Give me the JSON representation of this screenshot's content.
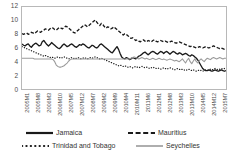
{
  "chart_data": {
    "type": "line",
    "title": "",
    "xlabel": "",
    "ylabel": "",
    "ylim": [
      0,
      12
    ],
    "yticks": [
      0,
      2,
      4,
      6,
      8,
      10,
      12
    ],
    "grid": false,
    "legend_position": "bottom",
    "x_tick_labels": [
      "2005M1",
      "2005M8",
      "2006M3",
      "2006M10",
      "2007M5",
      "2007M12",
      "2008M7",
      "2009M2",
      "2009M9",
      "2010M4",
      "2010M11",
      "2011M6",
      "2012M1",
      "2012M8",
      "2013M3",
      "2013M10",
      "2014M5",
      "2014M12",
      "2015M7"
    ],
    "x_tick_interval_months": 7,
    "x_start": "2005M1",
    "x_end": "2015M12",
    "n_points": 132,
    "series": [
      {
        "name": "Jamaica",
        "color": "#1a1a1a",
        "style": "solid",
        "values": [
          6.6,
          6.4,
          6.3,
          6.5,
          6.6,
          6.3,
          6.1,
          6.4,
          6.6,
          6.7,
          6.5,
          6.3,
          6.4,
          6.9,
          7.1,
          6.8,
          6.5,
          6.3,
          6.5,
          6.8,
          6.6,
          6.4,
          6.2,
          6.0,
          5.9,
          6.1,
          6.4,
          6.6,
          6.4,
          6.2,
          6.3,
          6.5,
          6.6,
          6.4,
          6.2,
          6.1,
          6.3,
          6.5,
          6.4,
          6.6,
          6.5,
          6.3,
          6.1,
          6.0,
          6.2,
          6.4,
          6.3,
          6.1,
          6.0,
          6.2,
          6.5,
          6.6,
          6.4,
          6.2,
          6.0,
          5.8,
          5.6,
          5.4,
          5.3,
          5.6,
          5.9,
          6.2,
          5.8,
          5.2,
          4.7,
          4.5,
          4.4,
          4.6,
          4.5,
          4.3,
          4.4,
          4.6,
          4.5,
          4.4,
          4.6,
          4.8,
          4.9,
          5.1,
          5.3,
          5.4,
          5.2,
          5.0,
          5.2,
          5.4,
          5.5,
          5.4,
          5.2,
          5.1,
          5.3,
          5.5,
          5.4,
          5.2,
          5.4,
          5.5,
          5.3,
          5.1,
          5.3,
          5.5,
          5.4,
          5.2,
          5.1,
          5.3,
          5.2,
          5.0,
          5.1,
          5.2,
          5.1,
          4.9,
          4.8,
          5.0,
          4.9,
          4.7,
          4.5,
          4.2,
          3.8,
          3.4,
          3.0,
          2.8,
          2.7,
          2.7,
          2.8,
          2.7,
          2.6,
          2.7,
          2.8,
          2.7,
          2.6,
          2.7,
          2.8,
          2.7,
          2.6,
          2.7
        ]
      },
      {
        "name": "Mauritius",
        "color": "#1a1a1a",
        "style": "dashed",
        "values": [
          8.1,
          8.0,
          8.1,
          8.2,
          8.0,
          8.1,
          8.3,
          8.2,
          8.1,
          8.3,
          8.5,
          8.4,
          8.3,
          8.5,
          8.6,
          8.8,
          8.7,
          8.6,
          8.8,
          9.0,
          8.9,
          8.7,
          8.6,
          8.8,
          9.0,
          8.9,
          8.8,
          9.0,
          9.2,
          9.1,
          8.9,
          8.7,
          8.5,
          8.3,
          8.2,
          8.4,
          8.6,
          8.8,
          9.0,
          9.2,
          9.4,
          9.3,
          9.1,
          9.3,
          9.5,
          9.7,
          9.9,
          10.1,
          9.8,
          9.5,
          9.3,
          9.6,
          9.4,
          9.1,
          8.9,
          9.1,
          9.0,
          8.8,
          8.9,
          9.1,
          8.9,
          8.7,
          8.5,
          8.3,
          8.1,
          7.9,
          8.1,
          8.0,
          7.8,
          7.6,
          7.4,
          7.5,
          7.3,
          7.1,
          7.2,
          7.0,
          6.9,
          7.1,
          7.2,
          7.0,
          6.9,
          7.1,
          7.0,
          6.9,
          7.1,
          7.2,
          7.0,
          6.9,
          7.0,
          7.1,
          7.0,
          6.9,
          7.0,
          6.9,
          6.8,
          6.9,
          7.0,
          6.9,
          6.8,
          6.7,
          6.8,
          6.9,
          6.8,
          6.7,
          6.6,
          6.5,
          6.4,
          6.3,
          6.2,
          6.3,
          6.2,
          6.1,
          6.0,
          6.1,
          6.2,
          6.1,
          6.0,
          6.1,
          6.2,
          6.1,
          6.0,
          6.1,
          6.2,
          6.3,
          6.2,
          6.1,
          6.0,
          5.9,
          6.0,
          5.9,
          5.8,
          5.9
        ]
      },
      {
        "name": "Trinidad and Tobago",
        "color": "#1a1a1a",
        "style": "dotted",
        "values": [
          6.2,
          6.1,
          6.0,
          5.9,
          5.8,
          5.7,
          5.6,
          5.5,
          5.4,
          5.3,
          5.2,
          5.1,
          5.0,
          4.9,
          4.8,
          4.9,
          4.8,
          4.7,
          4.6,
          4.7,
          4.6,
          4.5,
          4.6,
          4.7,
          4.6,
          4.5,
          4.6,
          4.7,
          4.6,
          4.5,
          4.4,
          4.5,
          4.6,
          4.5,
          4.4,
          4.5,
          4.6,
          4.5,
          4.4,
          4.5,
          4.6,
          4.5,
          4.4,
          4.5,
          4.6,
          4.5,
          4.6,
          4.7,
          4.6,
          4.5,
          4.4,
          4.5,
          4.4,
          4.3,
          4.2,
          4.1,
          4.0,
          3.9,
          3.8,
          3.7,
          3.6,
          3.5,
          3.4,
          3.5,
          3.4,
          3.3,
          3.4,
          3.3,
          3.2,
          3.3,
          3.2,
          3.1,
          3.2,
          3.3,
          3.2,
          3.1,
          3.2,
          3.3,
          3.2,
          3.1,
          3.2,
          3.1,
          3.0,
          3.1,
          3.2,
          3.1,
          3.0,
          3.1,
          3.0,
          2.9,
          3.0,
          3.1,
          3.0,
          2.9,
          3.0,
          3.1,
          3.0,
          2.9,
          2.8,
          2.9,
          3.0,
          2.9,
          2.8,
          2.9,
          2.8,
          2.7,
          2.8,
          2.9,
          2.8,
          2.7,
          2.8,
          2.7,
          2.6,
          2.7,
          2.8,
          2.7,
          2.6,
          2.7,
          2.8,
          2.7,
          2.8,
          2.9,
          2.8,
          2.9,
          3.0,
          2.9,
          2.8,
          2.9,
          3.0,
          2.9,
          3.0,
          3.1
        ]
      },
      {
        "name": "Seychelles",
        "color": "#9a9a9a",
        "style": "solid",
        "values": [
          4.5,
          4.5,
          4.5,
          4.5,
          4.5,
          4.5,
          4.5,
          4.5,
          4.4,
          4.4,
          4.4,
          4.4,
          4.4,
          4.4,
          4.4,
          4.4,
          4.4,
          4.4,
          4.4,
          4.4,
          4.3,
          4.0,
          3.5,
          3.3,
          3.2,
          3.2,
          3.3,
          3.4,
          3.6,
          3.8,
          4.1,
          4.3,
          4.4,
          4.4,
          4.4,
          4.4,
          4.4,
          4.4,
          4.4,
          4.4,
          4.4,
          4.4,
          4.4,
          4.4,
          4.4,
          4.4,
          4.4,
          4.4,
          4.4,
          4.4,
          4.4,
          4.4,
          4.4,
          4.4,
          4.4,
          4.4,
          4.4,
          4.4,
          4.4,
          4.4,
          4.4,
          4.4,
          4.4,
          4.4,
          4.4,
          4.4,
          4.4,
          4.4,
          4.4,
          4.4,
          4.5,
          4.6,
          4.7,
          4.6,
          4.5,
          4.4,
          4.5,
          4.6,
          4.5,
          4.4,
          4.5,
          4.4,
          4.3,
          4.4,
          4.5,
          4.4,
          4.3,
          4.4,
          4.5,
          4.4,
          4.3,
          4.4,
          4.3,
          4.2,
          4.3,
          4.4,
          4.3,
          4.2,
          4.1,
          4.2,
          4.1,
          4.0,
          4.2,
          4.4,
          4.1,
          3.8,
          4.2,
          4.5,
          4.0,
          3.7,
          4.1,
          4.4,
          4.0,
          3.8,
          4.2,
          4.4,
          4.2,
          4.0,
          4.3,
          4.5,
          4.4,
          4.3,
          4.5,
          4.6,
          4.5,
          4.4,
          4.5,
          4.6,
          4.5,
          4.4,
          4.5,
          4.5
        ]
      }
    ],
    "legend": [
      {
        "label": "Jamaica",
        "style": "solid",
        "color": "#1a1a1a"
      },
      {
        "label": "Mauritius",
        "style": "dashed",
        "color": "#1a1a1a"
      },
      {
        "label": "Trinidad and Tobago",
        "style": "dotted",
        "color": "#1a1a1a"
      },
      {
        "label": "Seychelles",
        "style": "solid",
        "color": "#9a9a9a"
      }
    ]
  }
}
